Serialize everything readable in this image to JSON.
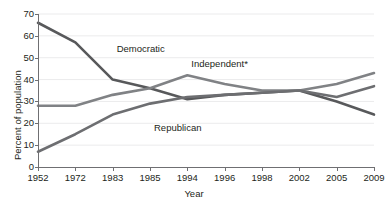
{
  "chart_data": {
    "type": "line",
    "title": "",
    "xlabel": "Year",
    "ylabel": "Percent of population",
    "categories": [
      "1952",
      "1972",
      "1983",
      "1985",
      "1994",
      "1996",
      "1998",
      "2002",
      "2005",
      "2009"
    ],
    "ylim": [
      0,
      70
    ],
    "yticks": [
      0,
      10,
      20,
      30,
      40,
      50,
      60,
      70
    ],
    "grid": true,
    "legend_position": "inline-labels",
    "series": [
      {
        "name": "Democratic",
        "color": "#58595b",
        "values": [
          66,
          57,
          40,
          36,
          31,
          33,
          34,
          35,
          30,
          24
        ]
      },
      {
        "name": "Independent*",
        "color": "#808285",
        "values": [
          28,
          28,
          33,
          36,
          42,
          38,
          35,
          35,
          38,
          43
        ]
      },
      {
        "name": "Republican",
        "color": "#6d6e71",
        "values": [
          7,
          15,
          24,
          29,
          32,
          33,
          34,
          35,
          32,
          37
        ]
      }
    ],
    "annotations": [
      {
        "text": "Democratic",
        "category": "1983",
        "value": 54
      },
      {
        "text": "Independent*",
        "category": "1994",
        "value": 47
      },
      {
        "text": "Republican",
        "category": "1985",
        "value": 18
      }
    ]
  }
}
